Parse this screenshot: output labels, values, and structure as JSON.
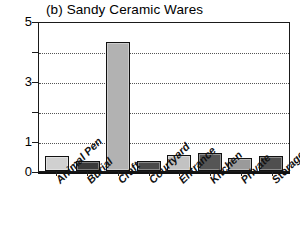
{
  "chart_data": {
    "type": "bar",
    "title": "(b) Sandy Ceramic Wares",
    "xlabel": "",
    "ylabel": "",
    "ylim": [
      0,
      5
    ],
    "grid": true,
    "legend": "none",
    "categories": [
      "Animal Pen",
      "Burial",
      "Craft",
      "Courtyard",
      "Entrance",
      "Kitchen",
      "Private",
      "Storage"
    ],
    "values": [
      0.5,
      0.33,
      4.3,
      0.35,
      0.55,
      0.6,
      0.45,
      0.5
    ],
    "bar_colors": [
      "#d0d0d0",
      "#3a3a3a",
      "#b2b2b2",
      "#4a4a4a",
      "#c2c2c2",
      "#555555",
      "#9a9a9a",
      "#4f4f4f"
    ],
    "y_ticks": [
      0,
      1,
      2,
      3,
      4,
      5
    ],
    "y_tick_labels": [
      "0",
      "1",
      "",
      "3",
      "",
      "5"
    ],
    "gridline_values": [
      1,
      2,
      3,
      4
    ]
  },
  "axis": {
    "y_labels_visible": [
      "5",
      "3",
      "1",
      "0"
    ]
  }
}
